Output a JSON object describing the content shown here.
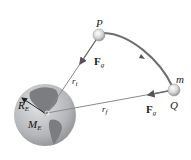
{
  "diagram": {
    "colors": {
      "trajectory": "#6e6e6e",
      "vector": "#8a8a8a",
      "earth_ocean": "#b9babd",
      "earth_land": "#7b7d80",
      "ball": "#d8d8d8"
    },
    "points": {
      "P": {
        "label": "P"
      },
      "Q": {
        "label": "Q"
      },
      "mass": {
        "label": "m"
      }
    },
    "vectors": {
      "force_upper": {
        "symbol": "F",
        "sub": "g"
      },
      "force_lower": {
        "symbol": "F",
        "sub": "g"
      },
      "r_initial": {
        "symbol": "r",
        "sub": "i"
      },
      "r_final": {
        "symbol": "r",
        "sub": "f"
      }
    },
    "earth": {
      "radius": {
        "symbol": "R",
        "sub": "E"
      },
      "mass": {
        "symbol": "M",
        "sub": "E"
      }
    }
  }
}
